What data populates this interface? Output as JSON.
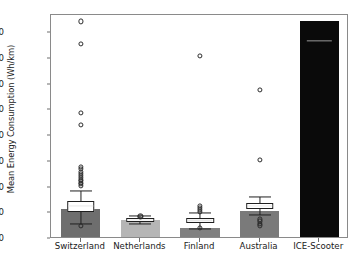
{
  "chart_data": {
    "type": "bar",
    "title": "",
    "xlabel": "",
    "ylabel": "Mean Energy Consumption (Wh/km)",
    "categories": [
      "Switzerland",
      "Netherlands",
      "Finland",
      "Australia",
      "ICE-Scooter"
    ],
    "values": [
      117,
      75,
      43,
      107,
      845
    ],
    "ylim": [
      0,
      870
    ],
    "yticks": [
      0,
      100,
      200,
      300,
      400,
      500,
      600,
      700,
      800
    ],
    "ytick_labels": [
      "0",
      "100",
      "200",
      "300",
      "400",
      "500",
      "600",
      "700",
      "800"
    ],
    "grid": false,
    "legend": "none",
    "bar_colors": [
      "#6e6e6e",
      "#b5b5b5",
      "#808080",
      "#7a7a7a",
      "#0a0a0a"
    ],
    "series": [
      {
        "name": "Mean Energy Consumption",
        "values": [
          117,
          75,
          43,
          107,
          845
        ]
      }
    ],
    "boxplots": [
      {
        "category": "Switzerland",
        "q1": 104,
        "median": 129,
        "q3": 148,
        "whisker_low": 57,
        "whisker_high": 186,
        "outliers": [
          845,
          757,
          490,
          443,
          281,
          272,
          262,
          252,
          244,
          237,
          231,
          225,
          219,
          213,
          207,
          50
        ]
      },
      {
        "category": "Netherlands",
        "q1": 66,
        "median": 73,
        "q3": 80,
        "whisker_low": 60,
        "whisker_high": 88,
        "outliers": [
          90,
          85
        ]
      },
      {
        "category": "Finland",
        "q1": 63,
        "median": 72,
        "q3": 82,
        "whisker_low": 40,
        "whisker_high": 100,
        "outliers": [
          712,
          130,
          121,
          112,
          105,
          43
        ]
      },
      {
        "category": "Australia",
        "q1": 118,
        "median": 128,
        "q3": 138,
        "whisker_low": 95,
        "whisker_high": 165,
        "outliers": [
          578,
          308,
          76,
          68,
          60,
          53
        ]
      },
      {
        "category": "ICE-Scooter",
        "q1": 845,
        "median": 770,
        "q3": 845,
        "whisker_low": 845,
        "whisker_high": 845,
        "outliers": []
      }
    ]
  }
}
